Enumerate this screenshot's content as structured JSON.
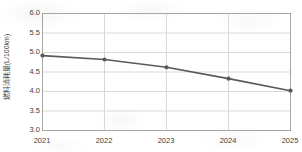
{
  "chart_data": {
    "type": "line",
    "title": "",
    "subtitle": "",
    "xlabel": "",
    "ylabel": "燃料消耗量(L/100km)",
    "categories": [
      "2021",
      "2022",
      "2023",
      "2024",
      "2025"
    ],
    "x": [
      2021,
      2022,
      2023,
      2024,
      2025
    ],
    "values": [
      4.92,
      4.82,
      4.62,
      4.33,
      4.02
    ],
    "series": [
      {
        "name": "燃料消耗量",
        "values": [
          4.92,
          4.82,
          4.62,
          4.33,
          4.02
        ]
      }
    ],
    "ylim": [
      3.0,
      6.0
    ],
    "ytick_labels": [
      "6.0",
      "5.5",
      "5.0",
      "4.5",
      "4.0",
      "3.5",
      "3.0"
    ],
    "ytick_values": [
      6.0,
      5.5,
      5.0,
      4.5,
      4.0,
      3.5,
      3.0
    ],
    "xtick_labels": [
      "2021",
      "2022",
      "2023",
      "2024",
      "2025"
    ],
    "grid": "horizontal-and-vertical",
    "legend": "none",
    "legend_position": "none",
    "line_color": "#595959",
    "marker_color": "#595959",
    "marker_shape": "circle",
    "grid_color": "#d9d9d9",
    "axis_color": "#a6a6a6",
    "text_color": "#3f3f3f",
    "background_color": "#ffffff"
  }
}
